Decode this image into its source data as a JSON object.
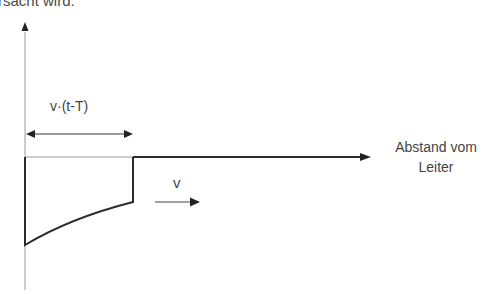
{
  "caption_fragment": "rsacht wird.",
  "diagram": {
    "span_label": "v·(t-T)",
    "velocity_label": "v",
    "x_axis_label_line1": "Abstand vom",
    "x_axis_label_line2": "Leiter"
  },
  "colors": {
    "line": "#2b2b2b",
    "axis": "#8a8a8a",
    "text": "#444444"
  }
}
